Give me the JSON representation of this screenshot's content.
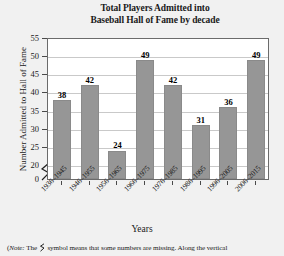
{
  "chart_data": {
    "type": "bar",
    "title": "Total Players Admitted into Baseball Hall of Fame by decade",
    "title_line1": "Total Players Admitted into",
    "title_line2": "Baseball Hall of Fame by decade",
    "xlabel": "Years",
    "ylabel": "Number Admitted to Hall of Fame",
    "categories": [
      "1936–1945",
      "1946–1955",
      "1956–1965",
      "1966–1975",
      "1976–1985",
      "1986–1995",
      "1996–2005",
      "2006–2015"
    ],
    "values": [
      38,
      42,
      24,
      49,
      42,
      31,
      36,
      49
    ],
    "yticks": [
      "0",
      "20",
      "25",
      "30",
      "35",
      "40",
      "45",
      "50",
      "55"
    ],
    "ylim": [
      20,
      55
    ],
    "y_axis_broken": true,
    "axis_break_between": [
      "0",
      "20"
    ],
    "grid": true,
    "legend": null,
    "bar_color": "#969696",
    "plot_background": "#ffffff",
    "page_background": "#f1f1f1"
  },
  "footnote": {
    "prefix": "(",
    "note_word": "Note:",
    "text_before_symbol": " The ",
    "symbol_name": "axis-break-symbol",
    "text_after_symbol": " symbol means that some numbers are missing. Along the vertical"
  }
}
